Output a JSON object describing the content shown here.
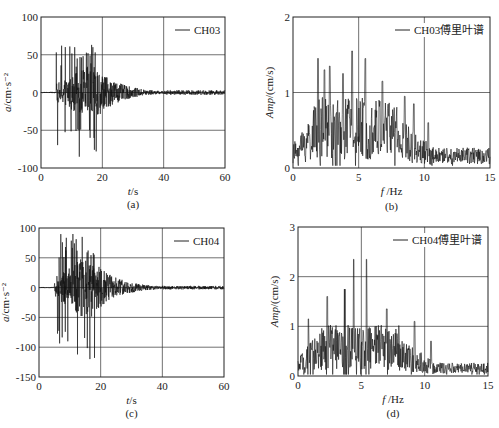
{
  "figure": {
    "panels": [
      {
        "id": "a",
        "caption": "(a)",
        "legend": "CH03",
        "xlabel_italic": "t",
        "xlabel_rest": "/s",
        "ylabel_italic": "a",
        "ylabel_rest": "/cm·s⁻²"
      },
      {
        "id": "b",
        "caption": "(b)",
        "legend": "CH03傅里叶谱",
        "xlabel_italic": "f",
        "xlabel_rest": " /Hz",
        "ylabel_italic": "Amp",
        "ylabel_rest": "/(cm/s)"
      },
      {
        "id": "c",
        "caption": "(c)",
        "legend": "CH04",
        "xlabel_italic": "t",
        "xlabel_rest": "/s",
        "ylabel_italic": "a",
        "ylabel_rest": "/cm·s⁻²"
      },
      {
        "id": "d",
        "caption": "(d)",
        "legend": "CH04傅里叶谱",
        "xlabel_italic": "f",
        "xlabel_rest": " /Hz",
        "ylabel_italic": "Amp",
        "ylabel_rest": "/(cm/s)"
      }
    ]
  },
  "chart_data": [
    {
      "id": "a",
      "type": "line",
      "title": "CH03 acceleration time history",
      "xlabel": "t/s",
      "ylabel": "a/cm·s^-2",
      "xlim": [
        0,
        60
      ],
      "ylim": [
        -100,
        100
      ],
      "xticks": [
        0,
        20,
        40,
        60
      ],
      "yticks": [
        -100,
        -50,
        0,
        50,
        100
      ],
      "grid": true,
      "legend": [
        "CH03"
      ],
      "legend_position": "upper right",
      "signal": {
        "onset": 5,
        "peak_time": 15,
        "decay_end": 60,
        "max_amp": 62,
        "min_amp": -85,
        "tail_amp": 3
      },
      "notable_points": [
        {
          "t": 11,
          "a": 60
        },
        {
          "t": 12.5,
          "a": -85
        },
        {
          "t": 16.5,
          "a": 63
        },
        {
          "t": 16,
          "a": -60
        },
        {
          "t": 18,
          "a": -78
        }
      ]
    },
    {
      "id": "b",
      "type": "line",
      "title": "CH03 Fourier spectrum",
      "xlabel": "f/Hz",
      "ylabel": "Amp/(cm/s)",
      "xlim": [
        0,
        15
      ],
      "ylim": [
        0,
        2
      ],
      "xticks": [
        0,
        5,
        10,
        15
      ],
      "yticks": [
        0,
        1,
        2
      ],
      "grid": true,
      "legend": [
        "CH03傅里叶谱"
      ],
      "legend_position": "upper right",
      "notable_points": [
        {
          "f": 1.9,
          "amp": 1.45
        },
        {
          "f": 2.4,
          "amp": 1.3
        },
        {
          "f": 2.8,
          "amp": 1.35
        },
        {
          "f": 3.8,
          "amp": 1.25
        },
        {
          "f": 4.5,
          "amp": 1.55
        },
        {
          "f": 5.5,
          "amp": 1.45
        },
        {
          "f": 6.8,
          "amp": 1.15
        },
        {
          "f": 8.5,
          "amp": 0.95
        },
        {
          "f": 9.2,
          "amp": 0.85
        },
        {
          "f": 10.3,
          "amp": 0.6
        },
        {
          "f": 13.5,
          "amp": 0.25
        }
      ]
    },
    {
      "id": "c",
      "type": "line",
      "title": "CH04 acceleration time history",
      "xlabel": "t/s",
      "ylabel": "a/cm·s^-2",
      "xlim": [
        0,
        60
      ],
      "ylim": [
        -150,
        100
      ],
      "xticks": [
        0,
        20,
        40,
        60
      ],
      "yticks": [
        -150,
        -100,
        -50,
        0,
        50,
        100
      ],
      "grid": true,
      "legend": [
        "CH04"
      ],
      "legend_position": "upper right",
      "signal": {
        "onset": 5,
        "peak_time": 14,
        "decay_end": 60,
        "max_amp": 90,
        "min_amp": -120,
        "tail_amp": 3
      },
      "notable_points": [
        {
          "t": 11,
          "a": 90
        },
        {
          "t": 12.5,
          "a": -112
        },
        {
          "t": 14,
          "a": 85
        },
        {
          "t": 16.5,
          "a": -120
        },
        {
          "t": 18,
          "a": -118
        }
      ]
    },
    {
      "id": "d",
      "type": "line",
      "title": "CH04 Fourier spectrum",
      "xlabel": "f/Hz",
      "ylabel": "Amp/(cm/s)",
      "xlim": [
        0,
        15
      ],
      "ylim": [
        0,
        3
      ],
      "xticks": [
        0,
        5,
        10,
        15
      ],
      "yticks": [
        0,
        1,
        2,
        3
      ],
      "grid": true,
      "legend": [
        "CH04傅里叶谱"
      ],
      "legend_position": "upper right",
      "notable_points": [
        {
          "f": 0.8,
          "amp": 1.15
        },
        {
          "f": 2.3,
          "amp": 1.6
        },
        {
          "f": 3.7,
          "amp": 1.75
        },
        {
          "f": 4.4,
          "amp": 2.35
        },
        {
          "f": 5.4,
          "amp": 2.35
        },
        {
          "f": 7.0,
          "amp": 1.35
        },
        {
          "f": 9.2,
          "amp": 1.1
        },
        {
          "f": 10.5,
          "amp": 0.7
        },
        {
          "f": 12.0,
          "amp": 0.6
        }
      ]
    }
  ],
  "layout": {
    "panels": [
      {
        "id": "a",
        "x0": 41,
        "y0": 17,
        "x1": 225,
        "y1": 168,
        "cap_y": 204
      },
      {
        "id": "b",
        "x0": 293,
        "y0": 17,
        "x1": 490,
        "y1": 168,
        "cap_y": 206
      },
      {
        "id": "c",
        "x0": 39,
        "y0": 228,
        "x1": 224,
        "y1": 377,
        "cap_y": 413
      },
      {
        "id": "d",
        "x0": 298,
        "y0": 227,
        "x1": 488,
        "y1": 376,
        "cap_y": 413
      }
    ]
  }
}
